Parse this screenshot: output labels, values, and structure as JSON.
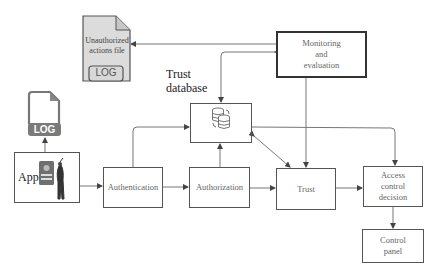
{
  "diagram": {
    "nodes": {
      "unauthorized_file": {
        "label_line1": "Unauthorized",
        "label_line2": "actions file",
        "badge": "LOG"
      },
      "log_icon": {
        "badge": "LOG"
      },
      "monitoring": {
        "line1": "Monitoring",
        "line2": "and",
        "line3": "evaluation"
      },
      "trust_database": {
        "line1": "Trust",
        "line2": "database"
      },
      "app": {
        "label": "App"
      },
      "authentication": {
        "label": "Authentication"
      },
      "authorization": {
        "label": "Authorization"
      },
      "trust": {
        "label": "Trust"
      },
      "access_control": {
        "line1": "Access",
        "line2": "control",
        "line3": "decision"
      },
      "control_panel": {
        "line1": "Control",
        "line2": "panel"
      }
    },
    "edges": [
      {
        "from": "app",
        "to": "log_icon"
      },
      {
        "from": "app",
        "to": "authentication"
      },
      {
        "from": "authentication",
        "to": "authorization"
      },
      {
        "from": "authentication",
        "to": "trust_database"
      },
      {
        "from": "authorization",
        "to": "trust_database"
      },
      {
        "from": "authorization",
        "to": "trust"
      },
      {
        "from": "trust",
        "to": "access_control"
      },
      {
        "from": "trust_database",
        "to": "trust",
        "bidirectional": true
      },
      {
        "from": "trust_database",
        "to": "access_control"
      },
      {
        "from": "monitoring",
        "to": "unauthorized_file"
      },
      {
        "from": "monitoring",
        "to": "trust_database",
        "bidirectional": true
      },
      {
        "from": "monitoring",
        "to": "trust"
      },
      {
        "from": "access_control",
        "to": "control_panel"
      }
    ],
    "colors": {
      "line": "#777777",
      "box_border": "#555555",
      "file_fill": "#dcdcdc",
      "log_badge": "#7a7a7a"
    }
  }
}
